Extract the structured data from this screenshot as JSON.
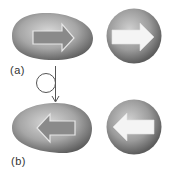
{
  "panels": [
    {
      "label": "(a)",
      "egg_arrow_direction": "right",
      "sphere_arrow_direction": "right"
    },
    {
      "label": "(b)",
      "egg_arrow_direction": "left",
      "sphere_arrow_direction": "left"
    }
  ],
  "transition": {
    "icon": "loop-arrow-icon",
    "from": "(a)",
    "to": "(b)"
  },
  "colors": {
    "shape_light": "#d4d4d4",
    "shape_mid": "#a0a0a0",
    "shape_dark": "#5e5e5e",
    "egg_arrow_fill": "#8a8a8a",
    "egg_arrow_stroke": "#e6e6e6",
    "sphere_arrow_fill": "#f4f4f4",
    "line": "#555555"
  }
}
